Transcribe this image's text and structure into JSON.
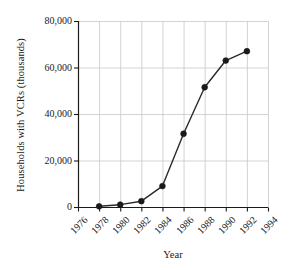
{
  "chart_data": {
    "type": "line",
    "title": "",
    "xlabel": "Year",
    "ylabel": "Households with VCRs (thousands)",
    "xlim": [
      1976,
      1994
    ],
    "ylim": [
      0,
      80000
    ],
    "grid": true,
    "legend": "none",
    "marker": "filled-circle",
    "line_color": "#2a2a2a",
    "marker_color": "#1a1a1a",
    "grid_color": "#c8c8c8",
    "axis_color": "#1a1a1a",
    "background": "#ffffff",
    "x": [
      1978,
      1980,
      1982,
      1984,
      1986,
      1988,
      1990,
      1992
    ],
    "values": [
      300,
      1000,
      2500,
      9000,
      31500,
      51500,
      63000,
      67000
    ],
    "series": [
      {
        "name": "Households with VCRs",
        "points": [
          {
            "year": 1978,
            "value": 300
          },
          {
            "year": 1980,
            "value": 1000
          },
          {
            "year": 1982,
            "value": 2500
          },
          {
            "year": 1984,
            "value": 9000
          },
          {
            "year": 1986,
            "value": 31500
          },
          {
            "year": 1988,
            "value": 51500
          },
          {
            "year": 1990,
            "value": 63000
          },
          {
            "year": 1992,
            "value": 67000
          }
        ]
      }
    ],
    "x_tick_values": [
      1976,
      1978,
      1980,
      1982,
      1984,
      1986,
      1988,
      1990,
      1992,
      1994
    ],
    "x_tick_labels": [
      "1976",
      "1978",
      "1980",
      "1982",
      "1984",
      "1986",
      "1988",
      "1990",
      "1992",
      "1994"
    ],
    "y_tick_values": [
      0,
      20000,
      40000,
      60000,
      80000
    ],
    "y_tick_labels": [
      "0",
      "20,000",
      "40,000",
      "60,000",
      "80,000"
    ]
  }
}
